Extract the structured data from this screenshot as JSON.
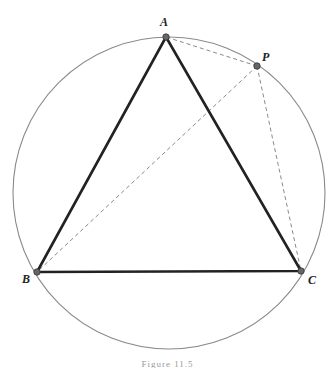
{
  "diagram": {
    "caption": "Figure 11.5",
    "circle": {
      "cx": 169,
      "cy": 193,
      "r": 156,
      "color": "#8a8a8a"
    },
    "points": {
      "A": {
        "label": "A",
        "x": 166,
        "y": 37
      },
      "P": {
        "label": "P",
        "x": 257,
        "y": 66
      },
      "B": {
        "label": "B",
        "x": 37,
        "y": 272
      },
      "C": {
        "label": "C",
        "x": 301,
        "y": 271
      }
    },
    "triangle": {
      "vertices": [
        "A",
        "B",
        "C"
      ],
      "color": "#222222",
      "stroke_width": 2.6
    },
    "dashed_segments": [
      {
        "from": "P",
        "to": "A"
      },
      {
        "from": "P",
        "to": "B"
      },
      {
        "from": "P",
        "to": "C"
      }
    ],
    "dashed_color": "#8a8a8a",
    "point_color": "#666666"
  }
}
